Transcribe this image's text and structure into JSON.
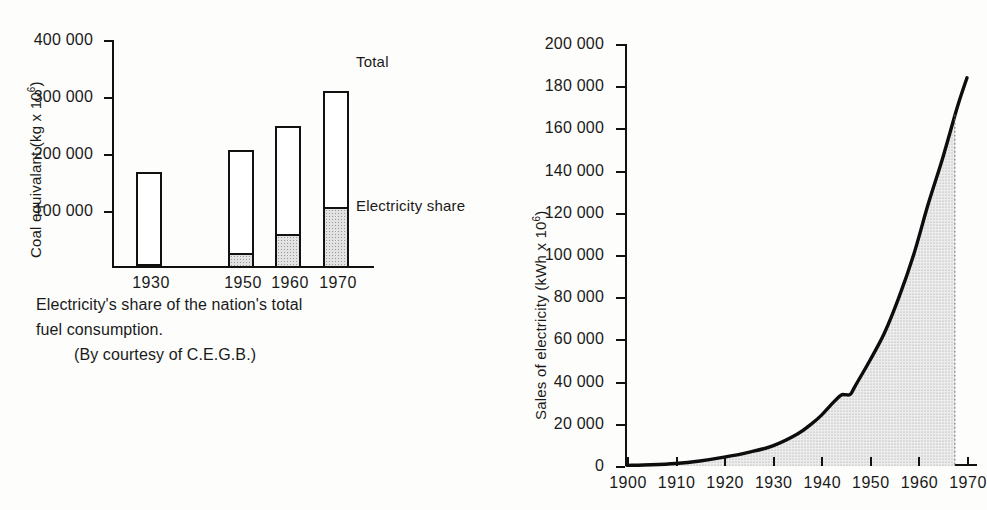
{
  "figure": {
    "left": {
      "caption_lines": [
        "Electricity's share of the nation's total",
        "fuel consumption.",
        "(By courtesy of C.E.G.B.)"
      ],
      "caption_line1": "Electricity's share of the nation's total",
      "caption_line2": "fuel consumption.",
      "caption_line3": "(By courtesy of C.E.G.B.)",
      "ylabel": "Coal equivalant (kg x 10⁶)",
      "ylabel_plain": "Coal equivalant (kg x 10",
      "ylabel_exp": "6",
      "ylabel_tail": ")",
      "legend_total": "Total",
      "legend_share": "Electricity share",
      "ticks": [
        "400 000",
        "300 000",
        "200 000",
        "100 000"
      ]
    },
    "right": {
      "ylabel_plain": "Sales of electricity (kWh x 10",
      "ylabel_exp": "6",
      "ylabel_tail": ")",
      "ticks": [
        "200 000",
        "180 000",
        "160 000",
        "140 000",
        "120 000",
        "100 000",
        "80 000",
        "60 000",
        "40 000",
        "20 000",
        "0"
      ],
      "xticks": [
        "1900",
        "1910",
        "1920",
        "1930",
        "1940",
        "1950",
        "1960",
        "1970"
      ]
    }
  },
  "chart_data": [
    {
      "type": "bar",
      "id": "coal-equivalent-stacked-bar",
      "title": "Electricity's share of the nation's total fuel consumption.",
      "subtitle": "(By courtesy of C.E.G.B.)",
      "xlabel": "",
      "ylabel": "Coal equivalant (kg x 10^6)",
      "ylim": [
        0,
        400000
      ],
      "ytick_values": [
        100000,
        200000,
        300000,
        400000
      ],
      "ytick_labels": [
        "100 000",
        "200 000",
        "300 000",
        "400 000"
      ],
      "grid": false,
      "legend_position": "inline-right",
      "categories": [
        "1930",
        "1950",
        "1960",
        "1970"
      ],
      "series": [
        {
          "name": "Electricity share",
          "values": [
            7000,
            27000,
            59000,
            107000
          ],
          "fill": "stipple-grey"
        },
        {
          "name": "Total",
          "values": [
            168000,
            207000,
            250000,
            310000
          ],
          "fill": "white"
        }
      ],
      "annotations": [
        {
          "text": "Total",
          "target": "1970",
          "value": 310000
        },
        {
          "text": "Electricity share",
          "target": "1970",
          "value": 107000
        }
      ]
    },
    {
      "type": "area",
      "id": "sales-of-electricity-curve",
      "title": "",
      "xlabel": "",
      "ylabel": "Sales of electricity (kWh x 10^6)",
      "xlim": [
        1900,
        1970
      ],
      "ylim": [
        0,
        200000
      ],
      "xtick_values": [
        1900,
        1910,
        1920,
        1930,
        1940,
        1950,
        1960,
        1970
      ],
      "xtick_labels": [
        "1900",
        "1910",
        "1920",
        "1930",
        "1940",
        "1950",
        "1960",
        "1970"
      ],
      "ytick_values": [
        0,
        20000,
        40000,
        60000,
        80000,
        100000,
        120000,
        140000,
        160000,
        180000,
        200000
      ],
      "ytick_labels": [
        "0",
        "20 000",
        "40 000",
        "60 000",
        "80 000",
        "100 000",
        "120 000",
        "140 000",
        "160 000",
        "180 000",
        "200 000"
      ],
      "grid": false,
      "fill": "stipple-grey",
      "x": [
        1900,
        1905,
        1910,
        1915,
        1920,
        1925,
        1930,
        1935,
        1938,
        1940,
        1942,
        1944,
        1945,
        1946,
        1947,
        1950,
        1953,
        1956,
        1959,
        1962,
        1965,
        1968,
        1970
      ],
      "y": [
        300,
        600,
        1200,
        2400,
        4200,
        6500,
        9500,
        15000,
        20000,
        24000,
        29000,
        33500,
        33800,
        34000,
        38000,
        50000,
        63000,
        80000,
        100000,
        124000,
        146000,
        170000,
        184000
      ]
    }
  ]
}
